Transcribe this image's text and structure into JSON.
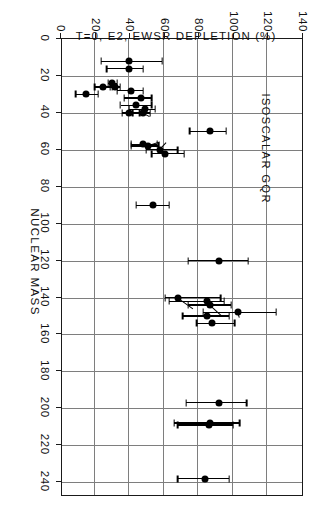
{
  "figure": {
    "annotation": "ISOSCALAR GQR",
    "rotation_deg": 90
  },
  "chart_data": {
    "type": "scatter",
    "title": "",
    "annotation": "ISOSCALAR GQR",
    "xlabel": "NUCLEAR MASS",
    "ylabel": "T=0, E2, EWSR DEPLETION (%)",
    "xlim": [
      0,
      248
    ],
    "ylim": [
      0,
      140
    ],
    "xticks": [
      0,
      20,
      40,
      60,
      80,
      100,
      120,
      140,
      160,
      180,
      200,
      220,
      240
    ],
    "xticklabels": [
      "0",
      "20",
      "40",
      "60",
      "80",
      "100",
      "120",
      "140",
      "160",
      "180",
      "200",
      "220",
      "240"
    ],
    "yticks": [
      0,
      20,
      40,
      60,
      80,
      100,
      120,
      140
    ],
    "yticklabels": [
      "0",
      "20",
      "40",
      "60",
      "80",
      "100",
      "120",
      "140"
    ],
    "grid": true,
    "grid_color": "#7e7e7e",
    "marker": "filled-circle",
    "marker_color": "#000000",
    "errorbar_direction": "y",
    "series": [
      {
        "name": "T=0 E2 EWSR depletion",
        "points": [
          {
            "x": 12,
            "y": 40,
            "yerr_low": 16,
            "yerr_high": 19
          },
          {
            "x": 16,
            "y": 40,
            "yerr_low": 13,
            "yerr_high": 8
          },
          {
            "x": 24,
            "y": 30,
            "yerr_low": 2,
            "yerr_high": 3
          },
          {
            "x": 26,
            "y": 32,
            "yerr_low": 3,
            "yerr_high": 3
          },
          {
            "x": 26,
            "y": 25,
            "yerr_low": 5,
            "yerr_high": 5
          },
          {
            "x": 28,
            "y": 41,
            "yerr_low": 8,
            "yerr_high": 7
          },
          {
            "x": 30,
            "y": 15,
            "yerr_low": 6,
            "yerr_high": 7
          },
          {
            "x": 32,
            "y": 47,
            "yerr_low": 10,
            "yerr_high": 6
          },
          {
            "x": 36,
            "y": 44,
            "yerr_low": 9,
            "yerr_high": 9
          },
          {
            "x": 38,
            "y": 49,
            "yerr_low": 9,
            "yerr_high": 6
          },
          {
            "x": 40,
            "y": 48,
            "yerr_low": 6,
            "yerr_high": 4
          },
          {
            "x": 40,
            "y": 40,
            "yerr_low": 4,
            "yerr_high": 6
          },
          {
            "x": 50,
            "y": 87,
            "yerr_low": 12,
            "yerr_high": 9
          },
          {
            "x": 57,
            "y": 48,
            "yerr_low": 7,
            "yerr_high": 8
          },
          {
            "x": 58,
            "y": 51,
            "yerr_low": 10,
            "yerr_high": 6
          },
          {
            "x": 60,
            "y": 58,
            "yerr_low": 8,
            "yerr_high": 10
          },
          {
            "x": 62,
            "y": 61,
            "yerr_low": 8,
            "yerr_high": 11
          },
          {
            "x": 90,
            "y": 54,
            "yerr_low": 10,
            "yerr_high": 9
          },
          {
            "x": 120,
            "y": 92,
            "yerr_low": 18,
            "yerr_high": 17
          },
          {
            "x": 140,
            "y": 68,
            "yerr_low": 7,
            "yerr_high": 25
          },
          {
            "x": 142,
            "y": 85,
            "yerr_low": 22,
            "yerr_high": 10
          },
          {
            "x": 144,
            "y": 87,
            "yerr_low": 13,
            "yerr_high": 12
          },
          {
            "x": 148,
            "y": 103,
            "yerr_low": 20,
            "yerr_high": 22
          },
          {
            "x": 150,
            "y": 85,
            "yerr_low": 14,
            "yerr_high": 13
          },
          {
            "x": 154,
            "y": 88,
            "yerr_low": 9,
            "yerr_high": 13
          },
          {
            "x": 197,
            "y": 92,
            "yerr_low": 19,
            "yerr_high": 16
          },
          {
            "x": 208,
            "y": 87,
            "yerr_low": 21,
            "yerr_high": 17
          },
          {
            "x": 209,
            "y": 86,
            "yerr_low": 18,
            "yerr_high": 14
          },
          {
            "x": 238,
            "y": 84,
            "yerr_low": 16,
            "yerr_high": 14
          }
        ],
        "connectors": [
          {
            "x1": 40,
            "y1": 48,
            "x2": 42,
            "y2": 52
          },
          {
            "x1": 58,
            "y1": 51,
            "x2": 56,
            "y2": 58
          },
          {
            "x1": 60,
            "y1": 58,
            "x2": 56,
            "y2": 62
          },
          {
            "x1": 140,
            "y1": 68,
            "x2": 146,
            "y2": 77
          },
          {
            "x1": 144,
            "y1": 87,
            "x2": 150,
            "y2": 94
          },
          {
            "x1": 148,
            "y1": 103,
            "x2": 151,
            "y2": 104
          }
        ]
      }
    ]
  }
}
